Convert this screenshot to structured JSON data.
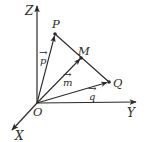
{
  "diagram": {
    "type": "3d-vector-coordinate-system",
    "colors": {
      "line": "#2a2a2a",
      "background": "#ffffff"
    },
    "origin": {
      "label": "O",
      "x": 37,
      "y": 103
    },
    "axes": [
      {
        "name": "Z",
        "label": "Z",
        "end": [
          37,
          5
        ]
      },
      {
        "name": "Y",
        "label": "Y",
        "end": [
          137,
          102
        ]
      },
      {
        "name": "X",
        "label": "X",
        "end": [
          11,
          131
        ]
      }
    ],
    "points": [
      {
        "name": "P",
        "label": "P",
        "x": 55,
        "y": 34
      },
      {
        "name": "M",
        "label": "M",
        "x": 81,
        "y": 58
      },
      {
        "name": "Q",
        "label": "Q",
        "x": 109,
        "y": 82
      }
    ],
    "vectors": [
      {
        "name": "p",
        "label": "p",
        "from": "O",
        "to": "P",
        "arrow": "→"
      },
      {
        "name": "m",
        "label": "m",
        "from": "O",
        "to": "M",
        "arrow": "→"
      },
      {
        "name": "q",
        "label": "q",
        "from": "O",
        "to": "Q",
        "arrow": "→"
      }
    ],
    "segments": [
      {
        "name": "PQ",
        "from": "P",
        "to": "Q"
      }
    ]
  }
}
